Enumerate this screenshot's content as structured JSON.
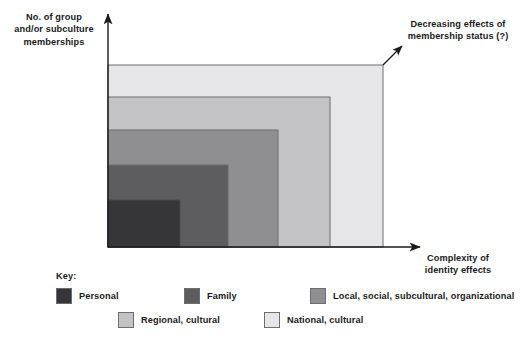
{
  "figure": {
    "y_axis_label": "No. of group\nand/or subculture\nmemberships",
    "x_axis_label": "Complexity of\nidentity effects",
    "annotation": "Decreasing effects of\nmembership status (?)",
    "legend_title": "Key:"
  },
  "chart_data": {
    "type": "bar",
    "title": "",
    "xlabel": "Complexity of identity effects",
    "ylabel": "No. of group and/or subculture memberships",
    "grid": false,
    "legend_position": "bottom-left",
    "annotations": [
      "Decreasing effects of membership status (?)"
    ],
    "categories": [
      "Personal",
      "Family",
      "Local, social, subcultural, organizational",
      "Regional, cultural",
      "National, cultural"
    ],
    "colors": [
      "#35353a",
      "#5d5d60",
      "#8f8f92",
      "#c3c3c5",
      "#e6e6e8"
    ],
    "series": [
      {
        "name": "Nested identity levels",
        "width_px": [
          72,
          120,
          170,
          222,
          275
        ],
        "height_px": [
          47,
          82,
          117,
          150,
          182
        ]
      }
    ],
    "nesting": "concentric rectangles anchored at origin; each successive level is larger in both axes"
  },
  "levels": [
    {
      "key": "personal",
      "label": "Personal",
      "color": "#35353a",
      "x": 108,
      "y": 200,
      "w": 72,
      "h": 47
    },
    {
      "key": "family",
      "label": "Family",
      "color": "#5d5d60",
      "x": 108,
      "y": 165,
      "w": 120,
      "h": 82
    },
    {
      "key": "local",
      "label": "Local, social, subcultural, organizational",
      "color": "#8f8f92",
      "x": 108,
      "y": 130,
      "w": 170,
      "h": 117
    },
    {
      "key": "regional",
      "label": "Regional, cultural",
      "color": "#c3c3c5",
      "x": 108,
      "y": 97,
      "w": 222,
      "h": 150
    },
    {
      "key": "national",
      "label": "National, cultural",
      "color": "#e6e6e8",
      "x": 108,
      "y": 65,
      "w": 275,
      "h": 182
    }
  ],
  "axes": {
    "origin_x": 108,
    "origin_y": 247,
    "y_tip_y": 14,
    "x_tip_x": 420,
    "stroke": "#1b1b1b"
  },
  "pointer": {
    "from_x": 383,
    "from_y": 65,
    "to_x": 402,
    "to_y": 46
  }
}
